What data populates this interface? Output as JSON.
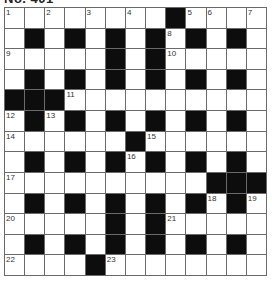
{
  "title": "No. 401",
  "puzzle": {
    "rows": 13,
    "cols": 13,
    "grid": [
      "........#....",
      ".#.#.#.#.#.#.",
      ".....#.#.....",
      ".#.#.#.#.#.#.",
      "###..........",
      ".#.#.#.#.#.#.",
      "......#......",
      ".#.#.#.#.#.#.",
      "..........###",
      ".#.#.#.#.#.#.",
      ".....#.#.....",
      ".#.#.#.#.#.#.",
      "....#........"
    ],
    "numbers": [
      {
        "n": "1",
        "r": 0,
        "c": 0
      },
      {
        "n": "2",
        "r": 0,
        "c": 2
      },
      {
        "n": "3",
        "r": 0,
        "c": 4
      },
      {
        "n": "4",
        "r": 0,
        "c": 6
      },
      {
        "n": "5",
        "r": 0,
        "c": 9
      },
      {
        "n": "6",
        "r": 0,
        "c": 10
      },
      {
        "n": "7",
        "r": 0,
        "c": 12
      },
      {
        "n": "8",
        "r": 1,
        "c": 8
      },
      {
        "n": "9",
        "r": 2,
        "c": 0
      },
      {
        "n": "10",
        "r": 2,
        "c": 8
      },
      {
        "n": "11",
        "r": 4,
        "c": 3
      },
      {
        "n": "12",
        "r": 5,
        "c": 0
      },
      {
        "n": "13",
        "r": 5,
        "c": 2
      },
      {
        "n": "14",
        "r": 6,
        "c": 0
      },
      {
        "n": "15",
        "r": 6,
        "c": 7
      },
      {
        "n": "16",
        "r": 7,
        "c": 6
      },
      {
        "n": "17",
        "r": 8,
        "c": 0
      },
      {
        "n": "18",
        "r": 9,
        "c": 10
      },
      {
        "n": "19",
        "r": 9,
        "c": 12
      },
      {
        "n": "20",
        "r": 10,
        "c": 0
      },
      {
        "n": "21",
        "r": 10,
        "c": 8
      },
      {
        "n": "22",
        "r": 12,
        "c": 0
      },
      {
        "n": "23",
        "r": 12,
        "c": 5
      }
    ]
  },
  "colors": {
    "black_cell": "#0d0d0d",
    "white_cell": "#ffffff",
    "grid_line": "#6a6a6a"
  }
}
